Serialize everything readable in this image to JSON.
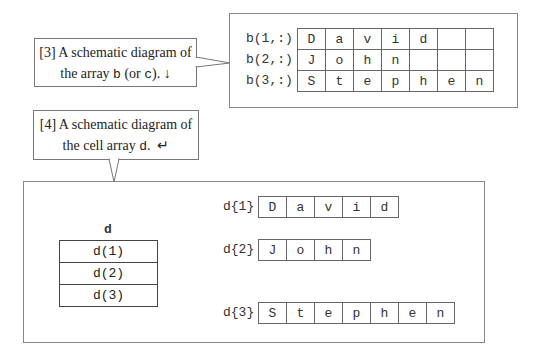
{
  "callout_array": {
    "line1": "[3] A schematic diagram of",
    "line2_prefix": "the array ",
    "line2_var1": "b",
    "line2_mid": " (or ",
    "line2_var2": "c",
    "line2_suffix": ").",
    "mark": "↓"
  },
  "callout_cell": {
    "line1": "[4] A schematic diagram of",
    "line2_prefix": "the cell array ",
    "line2_var": "d",
    "line2_suffix": ".",
    "mark": "↵"
  },
  "char_array": {
    "rows": [
      {
        "label": "b(1,:)",
        "cells": [
          "D",
          "a",
          "v",
          "i",
          "d",
          "",
          ""
        ]
      },
      {
        "label": "b(2,:)",
        "cells": [
          "J",
          "o",
          "h",
          "n",
          "",
          "",
          ""
        ]
      },
      {
        "label": "b(3,:)",
        "cells": [
          "S",
          "t",
          "e",
          "p",
          "h",
          "e",
          "n"
        ]
      }
    ]
  },
  "cell_array": {
    "name": "d",
    "elements": [
      "d(1)",
      "d(2)",
      "d(3)"
    ],
    "contents": [
      {
        "label": "d{1}",
        "cells": [
          "D",
          "a",
          "v",
          "i",
          "d"
        ]
      },
      {
        "label": "d{2}",
        "cells": [
          "J",
          "o",
          "h",
          "n"
        ]
      },
      {
        "label": "d{3}",
        "cells": [
          "S",
          "t",
          "e",
          "p",
          "h",
          "e",
          "n"
        ]
      }
    ]
  }
}
